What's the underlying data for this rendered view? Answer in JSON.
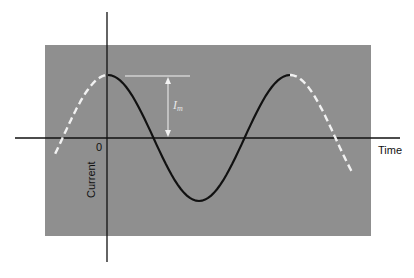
{
  "figure": {
    "background_color": "#8f8f8f",
    "curve_color": "#111111",
    "dashed_color": "#f2f2f2",
    "axis_color": "#111111"
  },
  "labels": {
    "origin": "0",
    "x_axis": "Time",
    "y_axis": "Current",
    "amplitude": "I",
    "amplitude_sub": "m"
  },
  "chart_data": {
    "type": "line",
    "title": "",
    "xlabel": "Time",
    "ylabel": "Current",
    "series": [
      {
        "name": "cosine current (solid, one period)",
        "style": "solid",
        "x_periods": [
          0,
          1
        ],
        "function": "I_m cos(2πt/T)"
      },
      {
        "name": "extension before t=0",
        "style": "dashed",
        "x_periods": [
          -0.27,
          0
        ]
      },
      {
        "name": "extension after one period",
        "style": "dashed",
        "x_periods": [
          1,
          1.35
        ]
      }
    ],
    "annotations": [
      {
        "text": "I_m",
        "meaning": "peak amplitude from axis to maximum"
      }
    ],
    "grid": false
  }
}
